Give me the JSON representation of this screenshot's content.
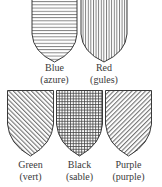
{
  "figure": {
    "line_color": "#3a3a3a",
    "tinctures": [
      {
        "id": "blue",
        "name": "Blue",
        "heraldic": "(azure)",
        "hatch": "horizontal"
      },
      {
        "id": "red",
        "name": "Red",
        "heraldic": "(gules)",
        "hatch": "vertical"
      },
      {
        "id": "green",
        "name": "Green",
        "heraldic": "(vert)",
        "hatch": "diagonal-dexter"
      },
      {
        "id": "black",
        "name": "Black",
        "heraldic": "(sable)",
        "hatch": "crosshatch"
      },
      {
        "id": "purple",
        "name": "Purple",
        "heraldic": "(purple)",
        "hatch": "diagonal-sinister"
      }
    ]
  }
}
